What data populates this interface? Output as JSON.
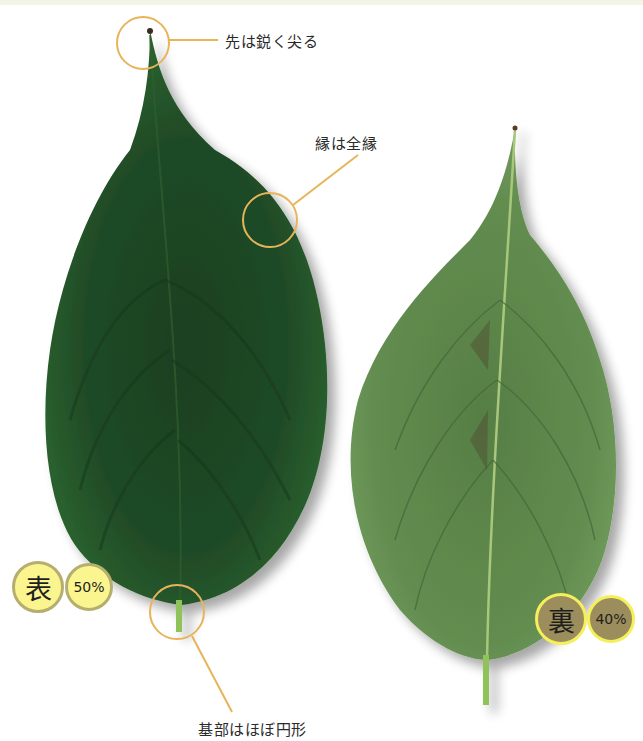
{
  "annotations": {
    "tip": "先は鋭く尖る",
    "margin": "縁は全縁",
    "base": "基部はほぼ円形"
  },
  "badges": {
    "front": {
      "label": "表",
      "scale": "50%"
    },
    "back": {
      "label": "裏",
      "scale": "40%"
    }
  },
  "colors": {
    "front_leaf": "#1f4a26",
    "back_leaf": "#5f8a4e",
    "callout": "#e8b45a",
    "petiole": "#8fc35a"
  }
}
